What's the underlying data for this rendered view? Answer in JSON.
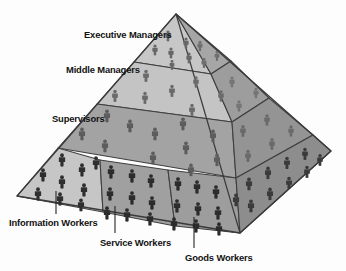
{
  "diagram": {
    "type": "pyramid",
    "title": "",
    "faces": {
      "left_face_name": "left-face",
      "right_face_name": "right-face"
    },
    "colors": {
      "background": "#fdfdfd",
      "light_band": "#c9c9c9",
      "light_band_2": "#c2c2c2",
      "mid_band": "#a8a8a8",
      "dark_band": "#9a9a9a",
      "right_light": "#a5a5a5",
      "right_mid": "#9b9b9b",
      "right_dark": "#8e8e8e",
      "outline": "#3a3a3a",
      "figure_light": "#6e6e6e",
      "figure_dark": "#3b3b3b",
      "leader_line": "#2a2a2a",
      "label_text": "#121212"
    },
    "levels": [
      {
        "id": "executive-managers",
        "label": "Executive Managers",
        "tier": 1,
        "position": "top",
        "label_x": 84,
        "label_y": 30,
        "shade": "light"
      },
      {
        "id": "middle-managers",
        "label": "Middle Managers",
        "tier": 2,
        "position": "upper-middle",
        "label_x": 66,
        "label_y": 65,
        "shade": "light"
      },
      {
        "id": "supervisors",
        "label": "Supervisors",
        "tier": 3,
        "position": "middle",
        "label_x": 52,
        "label_y": 114,
        "shade": "dark"
      },
      {
        "id": "information-workers",
        "label": "Information Workers",
        "tier": 4,
        "position": "base-left",
        "label_x": 9,
        "label_y": 221,
        "shade": "light"
      },
      {
        "id": "service-workers",
        "label": "Service Workers",
        "tier": 4,
        "position": "base-center",
        "label_x": 100,
        "label_y": 241,
        "shade": "dark"
      },
      {
        "id": "goods-workers",
        "label": "Goods Workers",
        "tier": 4,
        "position": "base-right",
        "label_x": 186,
        "label_y": 256,
        "shade": "dark"
      }
    ]
  }
}
